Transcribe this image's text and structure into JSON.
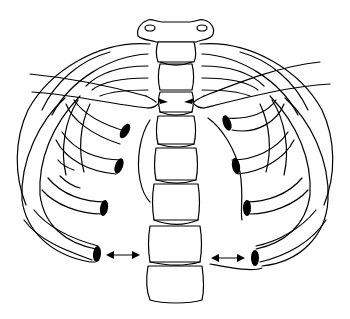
{
  "figure": {
    "title": "Thoracic rib cage and spine (anterior view) line illustration",
    "stroke_color": "#000000",
    "background_color": "#ffffff",
    "elements": {
      "spine": "vertebral-column",
      "clavicles": 2,
      "rib_stumps_left": 4,
      "rib_stumps_right": 4,
      "arrows": [
        {
          "type": "converging-arrows",
          "location": "upper spine, at clavicle junction"
        },
        {
          "type": "double-arrow",
          "location": "lower left, between rib end and spine"
        },
        {
          "type": "double-arrow",
          "location": "lower right, between spine and rib end"
        }
      ]
    }
  }
}
